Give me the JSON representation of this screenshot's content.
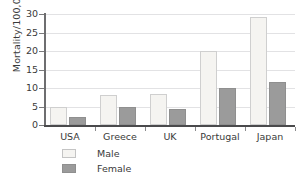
{
  "chart_data": {
    "type": "bar",
    "title": "",
    "xlabel": "",
    "ylabel": "Mortality/100,000",
    "categories": [
      "USA",
      "Greece",
      "UK",
      "Portugal",
      "Japan"
    ],
    "series": [
      {
        "name": "Male",
        "color": "#f5f4f1",
        "values": [
          4.9,
          8.1,
          8.4,
          20.0,
          29.2
        ]
      },
      {
        "name": "Female",
        "color": "#9b9b9b",
        "values": [
          2.2,
          4.9,
          4.3,
          10.0,
          11.7
        ]
      }
    ],
    "ylim": [
      0,
      30
    ],
    "yticks": [
      0,
      5,
      10,
      15,
      20,
      25,
      30
    ],
    "ytick_labels": [
      "0",
      "5",
      "10",
      "15",
      "20",
      "25",
      "30"
    ],
    "grid": "horizontal",
    "legend_position": "bottom-left"
  },
  "legend": {
    "items": [
      {
        "label": "Male",
        "swatch": "male-swatch"
      },
      {
        "label": "Female",
        "swatch": "female-swatch"
      }
    ]
  }
}
